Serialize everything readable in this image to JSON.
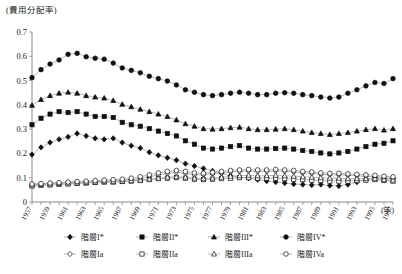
{
  "chart_data": {
    "type": "line",
    "title": "(費用分配率)",
    "xlabel": "(年)",
    "ylabel": "",
    "ylim": [
      0,
      0.7
    ],
    "ytick_labels": [
      "0",
      "0.1",
      "0.2",
      "0.3",
      "0.4",
      "0.5",
      "0.6",
      "0.7"
    ],
    "ytick_values": [
      0,
      0.1,
      0.2,
      0.3,
      0.4,
      0.5,
      0.6,
      0.7
    ],
    "grid": false,
    "legend_position": "bottom",
    "x": [
      1957,
      1958,
      1959,
      1960,
      1961,
      1962,
      1963,
      1964,
      1965,
      1966,
      1967,
      1968,
      1969,
      1970,
      1971,
      1972,
      1973,
      1974,
      1975,
      1976,
      1977,
      1978,
      1979,
      1980,
      1981,
      1982,
      1983,
      1984,
      1985,
      1986,
      1987,
      1988,
      1989,
      1990,
      1991,
      1992,
      1993,
      1994,
      1995,
      1996,
      1997
    ],
    "xtick_labels": [
      "1957",
      "1959",
      "1961",
      "1963",
      "1965",
      "1967",
      "1969",
      "1971",
      "1973",
      "1975",
      "1977",
      "1979",
      "1981",
      "1983",
      "1985",
      "1987",
      "1989",
      "1991",
      "1993",
      "1995",
      "1997"
    ],
    "series": [
      {
        "name": "階層I*",
        "marker": "diamond-filled",
        "values": [
          0.195,
          0.225,
          0.245,
          0.258,
          0.268,
          0.282,
          0.272,
          0.262,
          0.258,
          0.262,
          0.245,
          0.232,
          0.222,
          0.205,
          0.192,
          0.182,
          0.172,
          0.158,
          0.148,
          0.138,
          0.128,
          0.118,
          0.108,
          0.102,
          0.098,
          0.092,
          0.086,
          0.082,
          0.078,
          0.074,
          0.072,
          0.07,
          0.072,
          0.068,
          0.066,
          0.072,
          0.082,
          0.092,
          0.102,
          0.092,
          0.098
        ]
      },
      {
        "name": "階層II*",
        "marker": "square-filled",
        "values": [
          0.318,
          0.345,
          0.362,
          0.372,
          0.368,
          0.372,
          0.362,
          0.352,
          0.352,
          0.348,
          0.328,
          0.318,
          0.312,
          0.302,
          0.292,
          0.282,
          0.272,
          0.252,
          0.238,
          0.222,
          0.218,
          0.222,
          0.228,
          0.232,
          0.222,
          0.218,
          0.218,
          0.22,
          0.222,
          0.218,
          0.212,
          0.208,
          0.202,
          0.198,
          0.202,
          0.208,
          0.218,
          0.228,
          0.238,
          0.242,
          0.252
        ]
      },
      {
        "name": "階層III*",
        "marker": "triangle-filled",
        "values": [
          0.398,
          0.422,
          0.438,
          0.448,
          0.452,
          0.448,
          0.438,
          0.432,
          0.428,
          0.418,
          0.402,
          0.392,
          0.382,
          0.372,
          0.362,
          0.352,
          0.338,
          0.322,
          0.312,
          0.302,
          0.3,
          0.302,
          0.306,
          0.308,
          0.302,
          0.298,
          0.298,
          0.3,
          0.302,
          0.298,
          0.292,
          0.286,
          0.282,
          0.278,
          0.282,
          0.286,
          0.292,
          0.298,
          0.302,
          0.296,
          0.302
        ]
      },
      {
        "name": "階層IV*",
        "marker": "circle-filled",
        "values": [
          0.512,
          0.545,
          0.568,
          0.585,
          0.608,
          0.612,
          0.598,
          0.592,
          0.588,
          0.572,
          0.552,
          0.542,
          0.532,
          0.518,
          0.508,
          0.498,
          0.482,
          0.462,
          0.452,
          0.442,
          0.438,
          0.442,
          0.448,
          0.452,
          0.448,
          0.442,
          0.442,
          0.448,
          0.45,
          0.448,
          0.442,
          0.438,
          0.432,
          0.428,
          0.432,
          0.448,
          0.462,
          0.478,
          0.492,
          0.488,
          0.508
        ]
      },
      {
        "name": "階層Ia",
        "marker": "diamond-hollow",
        "values": [
          0.072,
          0.074,
          0.076,
          0.078,
          0.08,
          0.082,
          0.082,
          0.084,
          0.086,
          0.088,
          0.09,
          0.092,
          0.096,
          0.104,
          0.112,
          0.118,
          0.122,
          0.118,
          0.112,
          0.112,
          0.116,
          0.12,
          0.124,
          0.126,
          0.128,
          0.126,
          0.126,
          0.128,
          0.126,
          0.124,
          0.12,
          0.118,
          0.114,
          0.112,
          0.112,
          0.11,
          0.108,
          0.106,
          0.104,
          0.1,
          0.098
        ]
      },
      {
        "name": "階層IIa",
        "marker": "square-hollow",
        "values": [
          0.066,
          0.068,
          0.07,
          0.072,
          0.074,
          0.076,
          0.078,
          0.08,
          0.082,
          0.082,
          0.084,
          0.086,
          0.088,
          0.092,
          0.096,
          0.098,
          0.1,
          0.098,
          0.094,
          0.092,
          0.094,
          0.096,
          0.098,
          0.1,
          0.1,
          0.098,
          0.098,
          0.098,
          0.096,
          0.094,
          0.092,
          0.09,
          0.088,
          0.086,
          0.086,
          0.086,
          0.088,
          0.09,
          0.092,
          0.088,
          0.086
        ]
      },
      {
        "name": "階層IIIa",
        "marker": "triangle-hollow",
        "values": [
          0.07,
          0.072,
          0.074,
          0.076,
          0.078,
          0.078,
          0.08,
          0.082,
          0.084,
          0.084,
          0.086,
          0.088,
          0.09,
          0.094,
          0.098,
          0.102,
          0.104,
          0.102,
          0.098,
          0.096,
          0.098,
          0.102,
          0.106,
          0.108,
          0.11,
          0.108,
          0.108,
          0.11,
          0.108,
          0.106,
          0.104,
          0.102,
          0.1,
          0.098,
          0.098,
          0.096,
          0.096,
          0.096,
          0.096,
          0.092,
          0.09
        ]
      },
      {
        "name": "階層IVa",
        "marker": "circle-hollow",
        "values": [
          0.074,
          0.076,
          0.078,
          0.08,
          0.082,
          0.084,
          0.086,
          0.088,
          0.09,
          0.092,
          0.094,
          0.098,
          0.104,
          0.112,
          0.12,
          0.126,
          0.13,
          0.126,
          0.12,
          0.118,
          0.122,
          0.126,
          0.13,
          0.132,
          0.134,
          0.132,
          0.132,
          0.134,
          0.132,
          0.13,
          0.126,
          0.124,
          0.12,
          0.118,
          0.118,
          0.116,
          0.114,
          0.112,
          0.11,
          0.106,
          0.104
        ]
      }
    ]
  },
  "legend": {
    "rows": [
      [
        "階層I*",
        "階層II*",
        "階層III*",
        "階層IV*"
      ],
      [
        "階層Ia",
        "階層IIa",
        "階層IIIa",
        "階層IVa"
      ]
    ]
  }
}
